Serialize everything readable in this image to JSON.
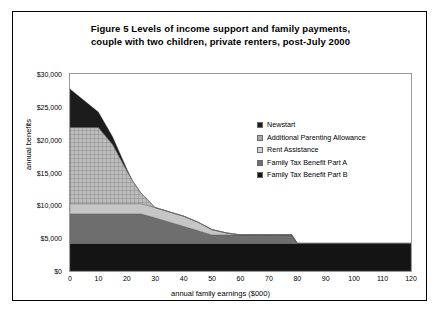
{
  "figure": {
    "title_line_1": "Figure 5   Levels of income support and family payments,",
    "title_line_2": "couple with two children, private renters, post-July 2000"
  },
  "chart_data": {
    "type": "area",
    "title": "Figure 5   Levels of income support and family payments, couple with two children, private renters, post-July 2000",
    "xlabel": "annual family earnings ($000)",
    "ylabel": "annual benefits",
    "xlim": [
      0,
      120
    ],
    "ylim": [
      0,
      30000
    ],
    "xticks": [
      "0",
      "10",
      "20",
      "30",
      "40",
      "50",
      "60",
      "70",
      "80",
      "90",
      "100",
      "110",
      "120"
    ],
    "xtick_values": [
      0,
      10,
      20,
      30,
      40,
      50,
      60,
      70,
      80,
      90,
      100,
      110,
      120
    ],
    "yticks": [
      "$0",
      "$5,000",
      "$10,000",
      "$15,000",
      "$20,000",
      "$25,000",
      "$30,000"
    ],
    "ytick_values": [
      0,
      5000,
      10000,
      15000,
      20000,
      25000,
      30000
    ],
    "grid": false,
    "stacked": true,
    "legend_position": "inside-right",
    "x": [
      0,
      5,
      10,
      15,
      20,
      22,
      25,
      30,
      35,
      40,
      45,
      50,
      55,
      60,
      65,
      70,
      75,
      78,
      80,
      90,
      100,
      110,
      120
    ],
    "series": [
      {
        "name": "Family Tax Benefit Part B",
        "color": "#141414",
        "values": [
          4200,
          4200,
          4200,
          4200,
          4200,
          4200,
          4200,
          4200,
          4200,
          4200,
          4200,
          4200,
          4200,
          4200,
          4200,
          4200,
          4200,
          4200,
          4200,
          4200,
          4200,
          4200,
          4200
        ]
      },
      {
        "name": "Family Tax Benefit Part A",
        "color": "#6e6e6e",
        "values": [
          4500,
          4500,
          4500,
          4500,
          4500,
          4500,
          4500,
          3900,
          3250,
          2600,
          1950,
          1300,
          1300,
          1300,
          1300,
          1300,
          1300,
          1300,
          0,
          0,
          0,
          0,
          0
        ]
      },
      {
        "name": "Rent Assistance",
        "color": "#c6c6c6",
        "values": [
          1550,
          1550,
          1550,
          1550,
          1550,
          1550,
          1550,
          1550,
          1550,
          1550,
          1300,
          800,
          300,
          0,
          0,
          0,
          0,
          0,
          0,
          0,
          0,
          0,
          0
        ]
      },
      {
        "name": "Additional Parenting Allowance",
        "color": "#a8a8a8",
        "pattern": "crosshatch",
        "values": [
          11600,
          11600,
          11600,
          9000,
          5000,
          3500,
          1600,
          0,
          0,
          0,
          0,
          0,
          0,
          0,
          0,
          0,
          0,
          0,
          0,
          0,
          0,
          0,
          0
        ]
      },
      {
        "name": "Newstart",
        "color": "#1c1c1c",
        "values": [
          5850,
          4100,
          2350,
          1200,
          300,
          0,
          0,
          0,
          0,
          0,
          0,
          0,
          0,
          0,
          0,
          0,
          0,
          0,
          0,
          0,
          0,
          0,
          0
        ]
      }
    ],
    "totals": [
      27700,
      25950,
      24200,
      20450,
      15550,
      13650,
      11550,
      9650,
      9000,
      8350,
      7450,
      6600,
      6100,
      5800,
      5800,
      5800,
      5800,
      5800,
      4200,
      4200,
      4200,
      4200,
      4200
    ]
  },
  "legend": {
    "items": [
      {
        "label": "Newstart",
        "color": "#1c1c1c"
      },
      {
        "label": "Additional Parenting Allowance",
        "color": "#a8a8a8"
      },
      {
        "label": "Rent Assistance",
        "color": "#d2d2d2"
      },
      {
        "label": "Family Tax Benefit Part A",
        "color": "#6e6e6e"
      },
      {
        "label": "Family Tax Benefit Part B",
        "color": "#141414"
      }
    ]
  }
}
